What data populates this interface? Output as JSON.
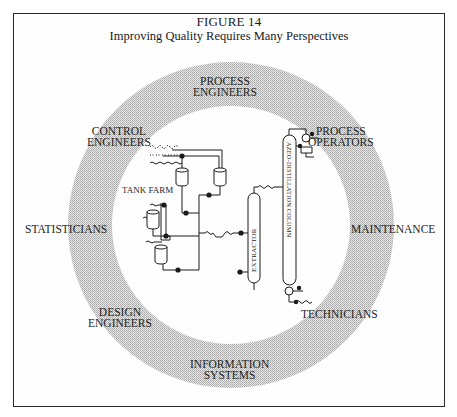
{
  "figure": {
    "number": "FIGURE 14",
    "title": "Improving Quality Requires Many Perspectives"
  },
  "ring": {
    "fill_color": "#c8c8c8",
    "labels": [
      {
        "id": "process-engineers",
        "line1": "PROCESS",
        "line2": "ENGINEERS"
      },
      {
        "id": "control-engineers",
        "line1": "CONTROL",
        "line2": "ENGINEERS"
      },
      {
        "id": "process-operators",
        "line1": "PROCESS",
        "line2": "OPERATORS"
      },
      {
        "id": "statisticians",
        "line1": "STATISTICIANS",
        "line2": ""
      },
      {
        "id": "maintenance",
        "line1": "MAINTENANCE",
        "line2": ""
      },
      {
        "id": "design-engineers",
        "line1": "DESIGN",
        "line2": "ENGINEERS"
      },
      {
        "id": "technicians",
        "line1": "TECHNICIANS",
        "line2": ""
      },
      {
        "id": "information-systems",
        "line1": "INFORMATION",
        "line2": "SYSTEMS"
      }
    ]
  },
  "process": {
    "tank_farm_label": "TANK FARM",
    "extractor_label": "EXTRACTOR",
    "column_label": "AZEO-DISTILLATION COLUMN"
  }
}
